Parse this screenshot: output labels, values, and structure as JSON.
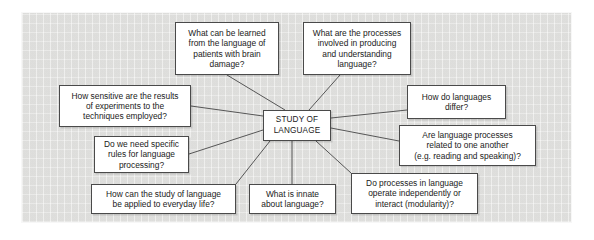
{
  "diagram": {
    "panel": {
      "background_color": "#e3e3e1",
      "border_color": "#4a4a4a"
    },
    "center": {
      "id": "center",
      "label": "STUDY OF\nLANGUAGE",
      "x": 263,
      "y": 110,
      "w": 68,
      "h": 31
    },
    "nodes": [
      {
        "id": "brain-damage",
        "label": "What can be learned\nfrom the language of\npatients with brain\ndamage?",
        "x": 175,
        "y": 22,
        "w": 104,
        "h": 53,
        "anchor": {
          "x": 227,
          "y": 75
        }
      },
      {
        "id": "processes-producing-understanding",
        "label": "What are the processes\ninvolved in producing\nand understanding\nlanguage?",
        "x": 303,
        "y": 22,
        "w": 108,
        "h": 53,
        "anchor": {
          "x": 340,
          "y": 75
        }
      },
      {
        "id": "sensitive-experiments",
        "label": "How sensitive are the results\nof experiments to the\ntechniques employed?",
        "x": 59,
        "y": 85,
        "w": 132,
        "h": 42,
        "anchor": {
          "x": 191,
          "y": 106
        }
      },
      {
        "id": "specific-rules",
        "label": "Do we need specific\nrules for language\nprocessing?",
        "x": 94,
        "y": 136,
        "w": 95,
        "h": 37,
        "anchor": {
          "x": 189,
          "y": 154
        }
      },
      {
        "id": "everyday-life",
        "label": "How can the study of language\nbe applied to everyday life?",
        "x": 91,
        "y": 184,
        "w": 145,
        "h": 30,
        "anchor": {
          "x": 236,
          "y": 184
        }
      },
      {
        "id": "innate-language",
        "label": "What is innate\nabout language?",
        "x": 249,
        "y": 184,
        "w": 87,
        "h": 30,
        "anchor": {
          "x": 292,
          "y": 184
        }
      },
      {
        "id": "modularity",
        "label": "Do processes in language\noperate independently or\ninteract (modularity)?",
        "x": 351,
        "y": 173,
        "w": 127,
        "h": 41,
        "anchor": {
          "x": 351,
          "y": 173
        }
      },
      {
        "id": "how-languages-differ",
        "label": "How do languages\ndiffer?",
        "x": 407,
        "y": 85,
        "w": 99,
        "h": 34,
        "anchor": {
          "x": 407,
          "y": 110
        }
      },
      {
        "id": "processes-related",
        "label": "Are language processes\nrelated to one another\n(e.g. reading and speaking)?",
        "x": 399,
        "y": 125,
        "w": 137,
        "h": 41,
        "anchor": {
          "x": 399,
          "y": 141
        }
      }
    ],
    "edges": [
      {
        "from": "center",
        "to": "brain-damage",
        "x1": 285,
        "y1": 110,
        "x2": 227,
        "y2": 75
      },
      {
        "from": "center",
        "to": "processes-producing-understanding",
        "x1": 309,
        "y1": 110,
        "x2": 340,
        "y2": 75
      },
      {
        "from": "center",
        "to": "sensitive-experiments",
        "x1": 263,
        "y1": 116,
        "x2": 191,
        "y2": 106
      },
      {
        "from": "center",
        "to": "specific-rules",
        "x1": 263,
        "y1": 130,
        "x2": 189,
        "y2": 154
      },
      {
        "from": "center",
        "to": "everyday-life",
        "x1": 270,
        "y1": 141,
        "x2": 236,
        "y2": 184
      },
      {
        "from": "center",
        "to": "innate-language",
        "x1": 292,
        "y1": 141,
        "x2": 292,
        "y2": 184
      },
      {
        "from": "center",
        "to": "modularity",
        "x1": 316,
        "y1": 141,
        "x2": 351,
        "y2": 173
      },
      {
        "from": "center",
        "to": "how-languages-differ",
        "x1": 331,
        "y1": 118,
        "x2": 407,
        "y2": 110
      },
      {
        "from": "center",
        "to": "processes-related",
        "x1": 331,
        "y1": 128,
        "x2": 399,
        "y2": 141
      }
    ]
  }
}
